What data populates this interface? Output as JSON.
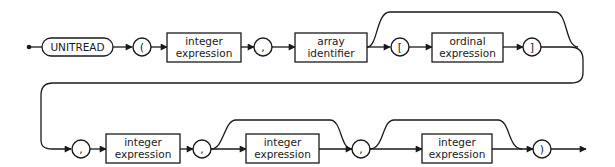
{
  "diagram": {
    "type": "syntax-railroad",
    "statement": "UNITREAD",
    "colors": {
      "line": "#1a1a1a",
      "background": "#ffffff"
    },
    "row1": {
      "keyword": "UNITREAD",
      "open_paren": "(",
      "box1_line1": "integer",
      "box1_line2": "expression",
      "comma1": ",",
      "box2_line1": "array",
      "box2_line2": "identifier",
      "open_bracket": "[",
      "box3_line1": "ordinal",
      "box3_line2": "expression",
      "close_bracket": "]"
    },
    "row2": {
      "comma2": ",",
      "box4_line1": "integer",
      "box4_line2": "expression",
      "comma3": ",",
      "box5_line1": "integer",
      "box5_line2": "expression",
      "comma4": ",",
      "box6_line1": "integer",
      "box6_line2": "expression",
      "close_paren": ")"
    },
    "optional_segments": [
      "[ ordinal expression ]",
      "integer expression (after third comma)",
      "integer expression (after fourth comma)"
    ]
  }
}
